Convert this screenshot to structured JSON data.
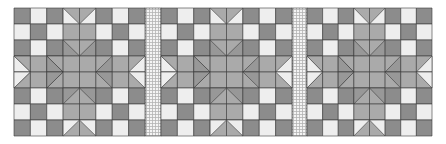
{
  "quilt": {
    "title": "Quilt pattern",
    "grid": {
      "top": 8,
      "rows": 8,
      "row_height": 16
    },
    "colors": {
      "dark": "#8c8c8c",
      "light": "#eeeeee",
      "medium": "#aaaaaa",
      "shade": "#989898",
      "line": "#3a3a3a",
      "sash_bg": "#f4f4f4",
      "sash_line": "#b4b4b4"
    },
    "blocks": [
      {
        "x": 14,
        "width": 131
      },
      {
        "x": 161,
        "width": 131
      },
      {
        "x": 307,
        "width": 125
      }
    ],
    "sashing": [
      {
        "x": 145,
        "width": 16
      },
      {
        "x": 292,
        "width": 15
      }
    ],
    "block_pattern": [
      [
        "D",
        "L",
        "D",
        "GD_L",
        "GD_L",
        "D",
        "L",
        "D"
      ],
      [
        "L",
        "D",
        "L",
        "M",
        "M",
        "L",
        "D",
        "L"
      ],
      [
        "D",
        "L",
        "D",
        "GD_S",
        "GD_S",
        "D",
        "L",
        "D"
      ],
      [
        "GR_L",
        "M",
        "GR_S",
        "M",
        "M",
        "GL_S",
        "M",
        "GL_L"
      ],
      [
        "GR_L",
        "M",
        "GR_S",
        "M",
        "M",
        "GL_S",
        "M",
        "GL_L"
      ],
      [
        "D",
        "L",
        "D",
        "GU_S",
        "GU_S",
        "D",
        "L",
        "D"
      ],
      [
        "L",
        "D",
        "L",
        "M",
        "M",
        "L",
        "D",
        "L"
      ],
      [
        "D",
        "L",
        "D",
        "GU_L",
        "GU_L",
        "D",
        "L",
        "D"
      ]
    ]
  }
}
